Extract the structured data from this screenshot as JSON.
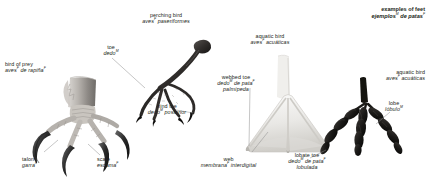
{
  "plate": {
    "header": {
      "en": "examples of feet",
      "es_pre": "ejemplos",
      "es_sup": "M",
      "es_post": " de patas",
      "es_sup2": "F"
    },
    "accent_color": "#231f20",
    "leader_color": "#8c8c8c",
    "background": "#ffffff"
  },
  "specimens": [
    {
      "id": "bird-of-prey",
      "en": "bird of prey",
      "es_pre": "aves",
      "es_sup": "F",
      "es_post": " de rapiña",
      "es_sup2": "F"
    },
    {
      "id": "perching-bird",
      "en": "perching bird",
      "es_pre": "aves",
      "es_sup": "F",
      "es_post": " paseriformes",
      "es_sup2": ""
    },
    {
      "id": "aquatic-bird-webbed",
      "en": "aquatic bird",
      "es_pre": "aves",
      "es_sup": "F",
      "es_post": " acuáticas",
      "es_sup2": ""
    },
    {
      "id": "aquatic-bird-lobate",
      "en": "aquatic bird",
      "es_pre": "aves",
      "es_sup": "F",
      "es_post": " acuáticas",
      "es_sup2": ""
    }
  ],
  "callouts": [
    {
      "id": "toe",
      "en": "toe",
      "es_pre": "dedo",
      "es_sup": "M",
      "es_post": "",
      "line3": ""
    },
    {
      "id": "hind-toe",
      "en": "hind toe",
      "es_pre": "dedo",
      "es_sup": "M",
      "es_post": " posterior",
      "line3": ""
    },
    {
      "id": "talon",
      "en": "talon",
      "es_pre": "garra",
      "es_sup": "F",
      "es_post": "",
      "line3": ""
    },
    {
      "id": "scale",
      "en": "scale",
      "es_pre": "escama",
      "es_sup": "F",
      "es_post": "",
      "line3": ""
    },
    {
      "id": "webbed-toe",
      "en": "webbed toe",
      "es_pre": "dedo",
      "es_sup": "M",
      "es_post": " de pata",
      "es_sup2": "F",
      "line3": "palmípeda"
    },
    {
      "id": "web",
      "en": "web",
      "es_pre": "membrana",
      "es_sup": "F",
      "es_post": " interdigital",
      "line3": ""
    },
    {
      "id": "lobate-toe",
      "en": "lobate toe",
      "es_pre": "dedo",
      "es_sup": "M",
      "es_post": " de pata",
      "es_sup2": "F",
      "line3": "lobulada"
    },
    {
      "id": "lobe",
      "en": "lobe",
      "es_pre": "lóbulo",
      "es_sup": "M",
      "es_post": "",
      "line3": ""
    }
  ]
}
